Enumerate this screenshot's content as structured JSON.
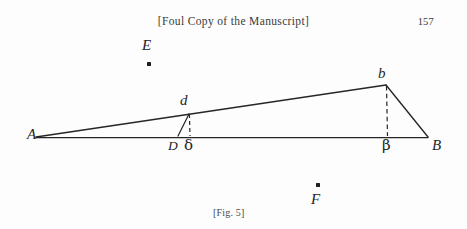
{
  "page": {
    "background_color": "#fdfdfd",
    "ink_color": "#262626",
    "width": 467,
    "height": 229
  },
  "header": {
    "running_head": "[Foul Copy of the Manuscript]",
    "folio": "157"
  },
  "caption": {
    "text": "[Fig. 5]"
  },
  "figure": {
    "name": "geometric-triangle-diagram",
    "stroke_color": "#262626",
    "labels": [
      {
        "id": "A",
        "text": "A",
        "kind": "latin-italic"
      },
      {
        "id": "B",
        "text": "B",
        "kind": "latin-italic"
      },
      {
        "id": "D",
        "text": "D",
        "kind": "latin-italic"
      },
      {
        "id": "delta",
        "text": "δ",
        "kind": "greek"
      },
      {
        "id": "beta",
        "text": "β",
        "kind": "greek"
      },
      {
        "id": "b",
        "text": "b",
        "kind": "latin-italic"
      },
      {
        "id": "d",
        "text": "d",
        "kind": "latin-italic"
      },
      {
        "id": "E",
        "text": "E",
        "kind": "latin-italic"
      },
      {
        "id": "F",
        "text": "F",
        "kind": "latin-italic"
      }
    ],
    "points": {
      "A": [
        36,
        137
      ],
      "B": [
        428,
        137
      ],
      "D": [
        178,
        137
      ],
      "delta": [
        189,
        137
      ],
      "beta": [
        387,
        137
      ],
      "b": [
        386,
        85
      ],
      "d": [
        189,
        113
      ],
      "E_dot": [
        148,
        64
      ],
      "F_dot": [
        317,
        185
      ]
    },
    "segments": [
      {
        "name": "baseline-A-B",
        "from": "A",
        "to": "B",
        "style": "solid"
      },
      {
        "name": "hypotenuse-A-b",
        "from": "A",
        "to": "b",
        "style": "solid"
      },
      {
        "name": "side-b-B",
        "from": "b",
        "to": "B",
        "style": "solid"
      },
      {
        "name": "altitude-b-beta",
        "from": "b",
        "to": "beta",
        "style": "dashed"
      },
      {
        "name": "oblique-D-d",
        "from": "D",
        "to": "d",
        "style": "solid"
      },
      {
        "name": "altitude-d-delta",
        "from": "d",
        "to": "delta",
        "style": "dashed"
      }
    ]
  }
}
